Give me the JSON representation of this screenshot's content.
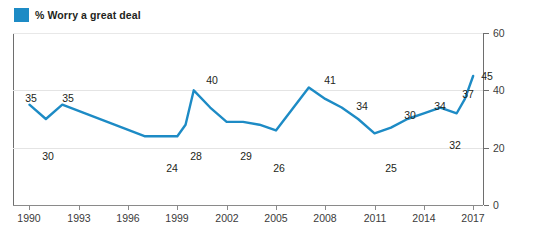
{
  "legend": {
    "label": "% Worry a great deal",
    "swatch_icon": "legend-square-icon",
    "color": "#1d8bc5"
  },
  "chart_data": {
    "type": "line",
    "title": "",
    "subtitle": "",
    "xlabel": "",
    "ylabel": "",
    "xlim": [
      1989,
      2017.6
    ],
    "ylim": [
      0,
      60
    ],
    "grid": true,
    "legend_position": "top-left",
    "line_color": "#1d8bc5",
    "series": [
      {
        "name": "% Worry a great deal",
        "x": [
          1990,
          1991,
          1992,
          1997,
          1999,
          1999.5,
          2000,
          2001,
          2002,
          2003,
          2004,
          2005,
          2007,
          2008,
          2009,
          2010,
          2011,
          2012,
          2013,
          2014,
          2015,
          2016,
          2016.5,
          2017
        ],
        "values": [
          35,
          30,
          35,
          24,
          24,
          28,
          40,
          34,
          29,
          29,
          28,
          26,
          41,
          37,
          34,
          30,
          25,
          27,
          30,
          32,
          34,
          32,
          37,
          45
        ]
      }
    ],
    "labeled_points": [
      {
        "label": "35",
        "x": 31,
        "y": 93
      },
      {
        "label": "30",
        "x": 48,
        "y": 151
      },
      {
        "label": "35",
        "x": 68,
        "y": 93
      },
      {
        "label": "24",
        "x": 172,
        "y": 163
      },
      {
        "label": "28",
        "x": 196,
        "y": 151
      },
      {
        "label": "40",
        "x": 212,
        "y": 75
      },
      {
        "label": "29",
        "x": 246,
        "y": 151
      },
      {
        "label": "26",
        "x": 279,
        "y": 163
      },
      {
        "label": "41",
        "x": 330,
        "y": 75
      },
      {
        "label": "34",
        "x": 362,
        "y": 101
      },
      {
        "label": "25",
        "x": 391,
        "y": 163
      },
      {
        "label": "30",
        "x": 410,
        "y": 110
      },
      {
        "label": "34",
        "x": 440,
        "y": 101
      },
      {
        "label": "32",
        "x": 455,
        "y": 140
      },
      {
        "label": "37",
        "x": 468,
        "y": 89
      },
      {
        "label": "45",
        "x": 487,
        "y": 71
      }
    ],
    "x_ticks": [
      {
        "label": "1990",
        "value": 1990
      },
      {
        "label": "1993",
        "value": 1993
      },
      {
        "label": "1996",
        "value": 1996
      },
      {
        "label": "1999",
        "value": 1999
      },
      {
        "label": "2002",
        "value": 2002
      },
      {
        "label": "2005",
        "value": 2005
      },
      {
        "label": "2008",
        "value": 2008
      },
      {
        "label": "2011",
        "value": 2011
      },
      {
        "label": "2014",
        "value": 2014
      },
      {
        "label": "2017",
        "value": 2017
      }
    ],
    "y_ticks": [
      {
        "label": "0",
        "value": 0
      },
      {
        "label": "20",
        "value": 20
      },
      {
        "label": "40",
        "value": 40
      },
      {
        "label": "60",
        "value": 60
      }
    ]
  }
}
